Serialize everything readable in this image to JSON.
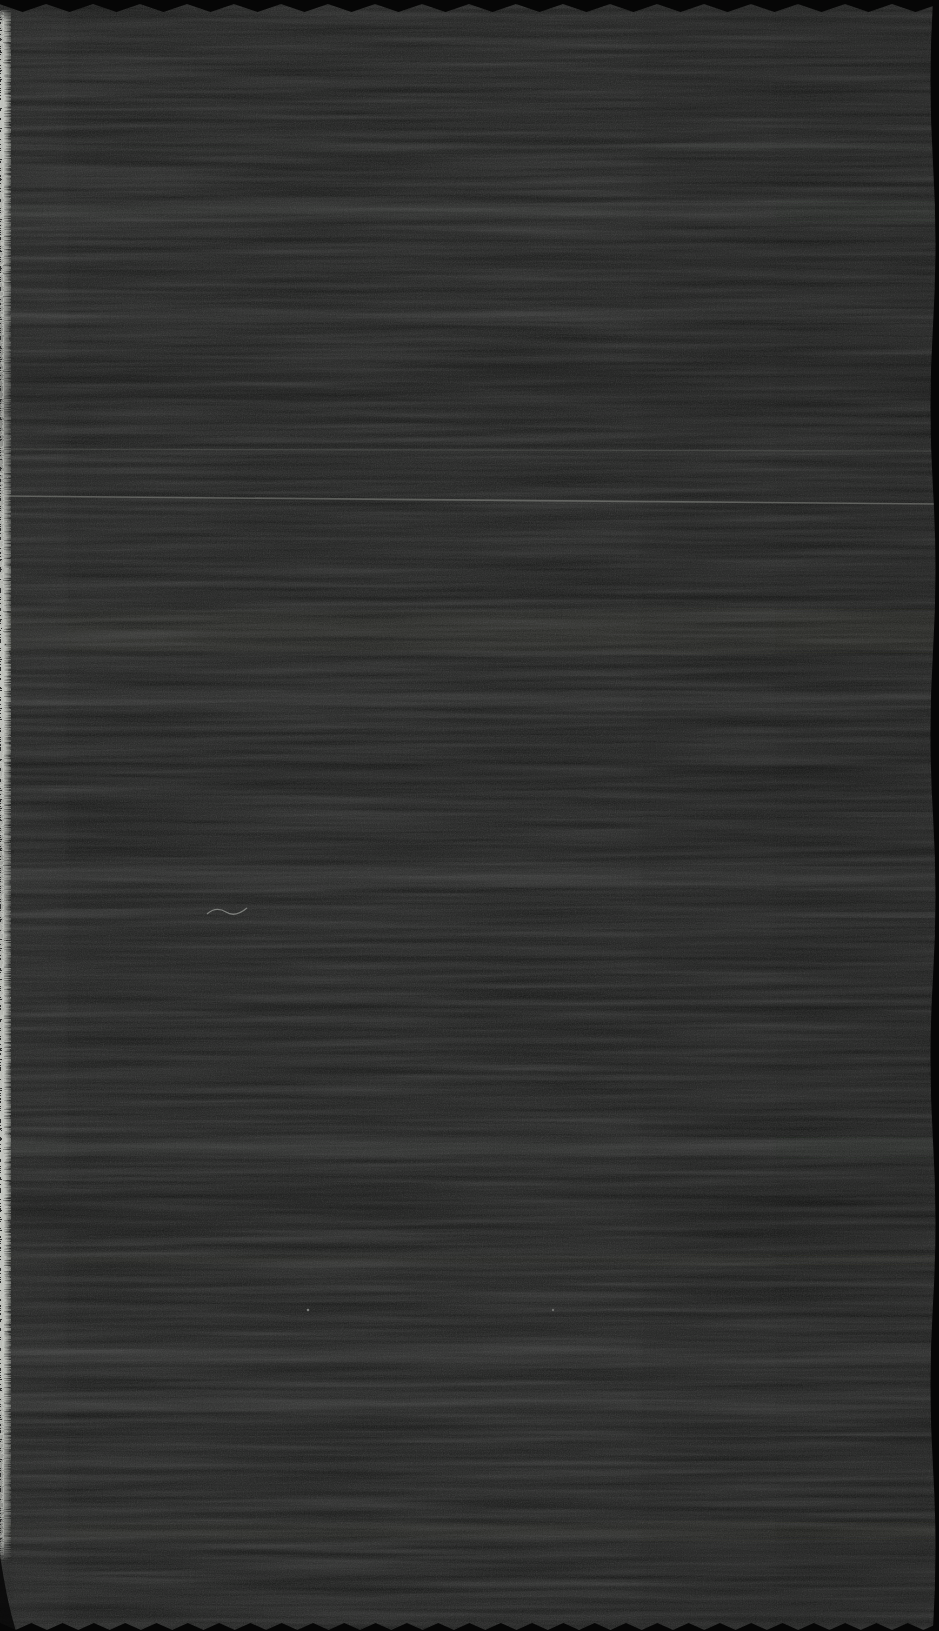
{
  "scene": {
    "description": "Flatbed scan of a black woven fabric swatch filling the frame: pale frayed selvage fringe along the left edge, pinked zigzag cut edges at top and bottom, a gently wavy scissor-cut right edge, faint horizontal weave streaks and bands, a thin pale weft thread crossing the cloth, a stray pale fibre and tiny dust specks."
  },
  "colors": {
    "background": "#060606",
    "fabric_base": "#161716",
    "band_light": "#a8aca6",
    "band_dark": "#000000",
    "weft_line": "#8a8c86",
    "fray_bright": "#c6c8c2",
    "fray_mid": "#999c96",
    "fiber": "#90928e",
    "speck": "#9a9c98"
  }
}
